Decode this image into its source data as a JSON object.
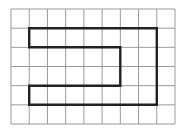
{
  "grid": {
    "cols": 9,
    "rows": 6,
    "origin_px": [
      11,
      9
    ],
    "size_px": [
      164,
      115
    ],
    "line_color": "#9a9a9a",
    "line_width": 1
  },
  "figure": {
    "name": "grid-polygon",
    "vertices": [
      [
        1,
        1
      ],
      [
        8,
        1
      ],
      [
        8,
        5
      ],
      [
        1,
        5
      ],
      [
        1,
        4
      ],
      [
        6,
        4
      ],
      [
        6,
        2
      ],
      [
        1,
        2
      ]
    ],
    "stroke_color": "#222222",
    "stroke_width": 2.4
  }
}
